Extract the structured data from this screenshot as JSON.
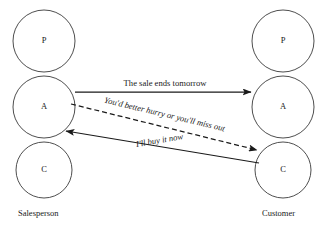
{
  "diagram": {
    "type": "transactional-analysis-ulterior-transaction",
    "background_color": "#ffffff",
    "line_color": "#1a1a1a",
    "circle_stroke_color": "#3a3a3a",
    "columns": [
      {
        "key": "salesperson",
        "actor_label": "Salesperson",
        "actor_label_x": 18,
        "actor_label_y": 216,
        "center_x": 44,
        "states": [
          {
            "key": "parent",
            "letter": "P",
            "cx": 44,
            "cy": 41,
            "r": 31
          },
          {
            "key": "adult",
            "letter": "A",
            "cx": 44,
            "cy": 107,
            "r": 31
          },
          {
            "key": "child",
            "letter": "C",
            "cx": 44,
            "cy": 170,
            "r": 28
          }
        ]
      },
      {
        "key": "customer",
        "actor_label": "Customer",
        "actor_label_x": 262,
        "actor_label_y": 216,
        "center_x": 283,
        "states": [
          {
            "key": "parent",
            "letter": "P",
            "cx": 283,
            "cy": 41,
            "r": 31
          },
          {
            "key": "adult",
            "letter": "A",
            "cx": 283,
            "cy": 107,
            "r": 31
          },
          {
            "key": "child",
            "letter": "C",
            "cx": 283,
            "cy": 170,
            "r": 28
          }
        ]
      }
    ],
    "transactions": [
      {
        "key": "social-message",
        "label": "The sale ends tomorrow",
        "style": "solid",
        "italic": false,
        "from": "salesperson-adult",
        "to": "customer-adult",
        "x1": 75,
        "y1": 92,
        "x2": 251,
        "y2": 92,
        "label_x": 165,
        "label_y": 86,
        "label_rotate": 0
      },
      {
        "key": "ulterior-message",
        "label": "You'd better hurry or you'll miss out",
        "style": "dashed",
        "italic": true,
        "from": "salesperson-adult",
        "to": "customer-child",
        "x1": 71,
        "y1": 104,
        "x2": 257,
        "y2": 150,
        "label_x": 164,
        "label_y": 117,
        "label_rotate": 13.5
      },
      {
        "key": "response-message",
        "label": "I'll buy it now",
        "style": "solid",
        "italic": true,
        "from": "customer-child",
        "to": "salesperson-adult",
        "x1": 259,
        "y1": 163,
        "x2": 66,
        "y2": 131,
        "label_x": 160,
        "label_y": 143,
        "label_rotate": -9.5
      }
    ]
  }
}
